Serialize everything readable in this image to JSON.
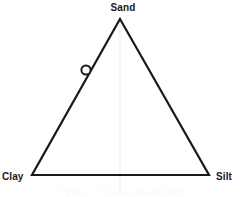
{
  "figure": {
    "type": "ternary-diagram",
    "caption": "Figure 1.5  Sand, silt and clay",
    "background_color": "#ffffff",
    "line_color": "#1a1a1a"
  },
  "vertices": {
    "top": {
      "label": "Sand",
      "x": 120,
      "y": 19
    },
    "bottom_left": {
      "label": "Clay",
      "x": 32,
      "y": 175
    },
    "bottom_right": {
      "label": "Silt",
      "x": 209,
      "y": 175
    }
  },
  "marker": {
    "name": "sample-point",
    "shape": "open-circle",
    "x": 86,
    "y": 70,
    "radius": 5,
    "fill": "#ffffff",
    "stroke": "#1a1a1a"
  },
  "guide_line": {
    "name": "apex-vertical-guide",
    "x": 120,
    "y_start": 19,
    "y_end": 190,
    "color": "#f4f4f4"
  },
  "chart_data": {
    "type": "scatter",
    "title": "",
    "axes": [
      "Sand",
      "Silt",
      "Clay"
    ],
    "points": [
      {
        "label": "",
        "Sand": 64,
        "Silt": 0,
        "Clay": 36
      }
    ]
  }
}
